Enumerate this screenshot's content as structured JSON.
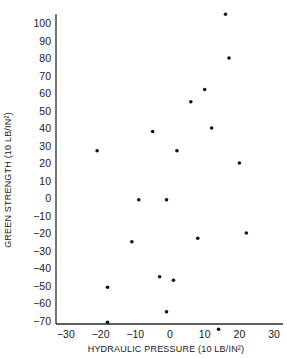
{
  "chart_data": {
    "type": "scatter",
    "title": "",
    "xlabel": "HYDRAULIC PRESSURE (10 LB/IN²)",
    "ylabel": "GREEN STRENGTH (10 LB/IN²)",
    "xlim": [
      -30,
      32
    ],
    "ylim": [
      -72,
      105
    ],
    "xticks": [
      -30,
      -20,
      -10,
      0,
      10,
      20,
      30
    ],
    "yticks": [
      100,
      90,
      80,
      70,
      60,
      50,
      40,
      30,
      20,
      10,
      0,
      -10,
      -20,
      -30,
      -40,
      -50,
      -60,
      -70
    ],
    "grid": false,
    "legend": null,
    "series": [
      {
        "name": "observations",
        "marker": "dot",
        "color": "#111111",
        "points": [
          {
            "x": 16,
            "y": 105
          },
          {
            "x": 17,
            "y": 80
          },
          {
            "x": 10,
            "y": 62
          },
          {
            "x": 6,
            "y": 55
          },
          {
            "x": 12,
            "y": 40
          },
          {
            "x": -5,
            "y": 38
          },
          {
            "x": 2,
            "y": 27
          },
          {
            "x": -21,
            "y": 27
          },
          {
            "x": 20,
            "y": 20
          },
          {
            "x": -9,
            "y": -1
          },
          {
            "x": -1,
            "y": -1
          },
          {
            "x": 22,
            "y": -20
          },
          {
            "x": 8,
            "y": -23
          },
          {
            "x": -11,
            "y": -25
          },
          {
            "x": -3,
            "y": -45
          },
          {
            "x": 1,
            "y": -47
          },
          {
            "x": -18,
            "y": -51
          },
          {
            "x": -1,
            "y": -65
          },
          {
            "x": -18,
            "y": -71
          },
          {
            "x": 14,
            "y": -75
          }
        ]
      }
    ]
  }
}
